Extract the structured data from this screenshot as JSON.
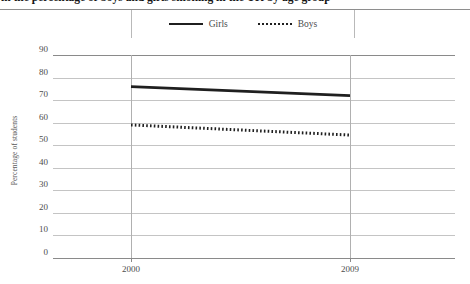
{
  "heading": {
    "text": "in the percentage of boys and girls smoking in the UK by age group",
    "truncated": true
  },
  "legend": {
    "position": "top-center",
    "entries": [
      {
        "label": "Girls",
        "style": "solid",
        "icon": "solid-line-icon",
        "color": "#1f1f1f"
      },
      {
        "label": "Boys",
        "style": "dotted",
        "icon": "dotted-line-icon",
        "color": "#1f1f1f"
      }
    ]
  },
  "chart_data": {
    "type": "line",
    "title": "",
    "xlabel": "",
    "ylabel": "Percentage of students",
    "x": [
      "2000",
      "2009"
    ],
    "ylim": [
      0,
      90
    ],
    "yticks": [
      90,
      80,
      70,
      60,
      50,
      40,
      30,
      20,
      10,
      0
    ],
    "grid": true,
    "legend_position": "top-center",
    "series": [
      {
        "name": "Girls",
        "style": "solid",
        "values": [
          76,
          72
        ]
      },
      {
        "name": "Boys",
        "style": "dotted",
        "values": [
          59,
          54.5
        ]
      }
    ]
  },
  "colors": {
    "line": "#1f1f1f",
    "grid": "#c4c4c4",
    "axis": "#8a8a8a",
    "text": "#4d4d4d"
  }
}
